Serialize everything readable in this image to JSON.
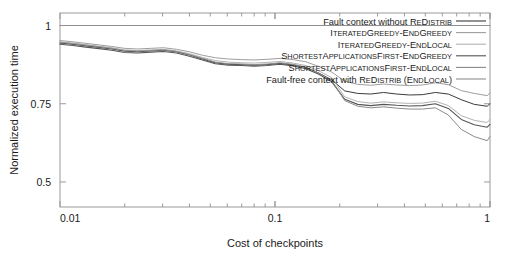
{
  "chart_data": {
    "type": "line",
    "title": "",
    "xlabel": "Cost of checkpoints",
    "ylabel": "Normalized execution time",
    "xscale": "log",
    "yscale": "linear",
    "xlim": [
      0.01,
      1
    ],
    "ylim": [
      0.42,
      1.04
    ],
    "xticks": [
      0.01,
      0.1,
      1
    ],
    "xticklabels": [
      "0.01",
      "0.1",
      "1"
    ],
    "yticks": [
      0.5,
      0.75,
      1
    ],
    "yticklabels": [
      "0.5",
      "0.75",
      "1"
    ],
    "grid": false,
    "legend_position": "top-right inside",
    "x": [
      0.01,
      0.0115,
      0.0132,
      0.0152,
      0.0174,
      0.02,
      0.023,
      0.0264,
      0.0303,
      0.0348,
      0.04,
      0.046,
      0.0528,
      0.0607,
      0.0697,
      0.08,
      0.0919,
      0.1056,
      0.1213,
      0.1393,
      0.16,
      0.1838,
      0.2111,
      0.2425,
      0.2786,
      0.32,
      0.3676,
      0.4223,
      0.4851,
      0.5572,
      0.64,
      0.7352,
      0.8445,
      0.97,
      1.0
    ],
    "series": [
      {
        "name": "Fault context without ReDistrib",
        "color": "#3a3a3a",
        "width": 1.0,
        "values": [
          0.944,
          0.94,
          0.935,
          0.93,
          0.925,
          0.918,
          0.916,
          0.919,
          0.921,
          0.916,
          0.906,
          0.893,
          0.881,
          0.876,
          0.875,
          0.873,
          0.875,
          0.879,
          0.874,
          0.866,
          0.848,
          0.826,
          0.791,
          0.783,
          0.781,
          0.786,
          0.781,
          0.778,
          0.779,
          0.786,
          0.781,
          0.763,
          0.748,
          0.742,
          0.75
        ]
      },
      {
        "name": "IteratedGreedy-EndGreedy",
        "color": "#9e9e9e",
        "width": 1.0,
        "values": [
          0.952,
          0.948,
          0.943,
          0.938,
          0.933,
          0.927,
          0.925,
          0.927,
          0.929,
          0.924,
          0.916,
          0.905,
          0.897,
          0.893,
          0.891,
          0.89,
          0.892,
          0.895,
          0.891,
          0.884,
          0.869,
          0.851,
          0.822,
          0.812,
          0.809,
          0.813,
          0.81,
          0.808,
          0.81,
          0.817,
          0.811,
          0.792,
          0.783,
          0.776,
          0.784
        ]
      },
      {
        "name": "IteratedGreedy-EndLocal",
        "color": "#b3b3b3",
        "width": 1.0,
        "values": [
          0.948,
          0.944,
          0.939,
          0.934,
          0.929,
          0.922,
          0.92,
          0.922,
          0.924,
          0.919,
          0.91,
          0.898,
          0.888,
          0.883,
          0.881,
          0.88,
          0.882,
          0.885,
          0.88,
          0.872,
          0.855,
          0.833,
          0.772,
          0.757,
          0.752,
          0.756,
          0.753,
          0.751,
          0.752,
          0.758,
          0.744,
          0.712,
          0.697,
          0.69,
          0.7
        ]
      },
      {
        "name": "ShortestApplicationsFirst-EndGreedy",
        "color": "#555555",
        "width": 1.1,
        "values": [
          0.94,
          0.936,
          0.931,
          0.926,
          0.921,
          0.914,
          0.912,
          0.915,
          0.917,
          0.912,
          0.902,
          0.89,
          0.878,
          0.873,
          0.872,
          0.87,
          0.872,
          0.876,
          0.871,
          0.862,
          0.844,
          0.82,
          0.764,
          0.748,
          0.744,
          0.748,
          0.745,
          0.743,
          0.744,
          0.75,
          0.735,
          0.7,
          0.683,
          0.675,
          0.684
        ]
      },
      {
        "name": "ShortestApplicationsFirst-EndLocal",
        "color": "#8a8a8a",
        "width": 1.0,
        "values": [
          0.946,
          0.942,
          0.937,
          0.932,
          0.927,
          0.92,
          0.918,
          0.92,
          0.922,
          0.917,
          0.907,
          0.895,
          0.883,
          0.878,
          0.877,
          0.875,
          0.877,
          0.881,
          0.876,
          0.867,
          0.848,
          0.824,
          0.76,
          0.742,
          0.737,
          0.74,
          0.736,
          0.733,
          0.733,
          0.737,
          0.714,
          0.668,
          0.645,
          0.632,
          0.645
        ]
      },
      {
        "name": "Fault-free context with ReDistrib (EndLocal)",
        "color": "#8f8f8f",
        "width": 1.1,
        "values": [
          1.0,
          1.0,
          1.0,
          1.0,
          1.0,
          1.0,
          1.0,
          1.0,
          1.0,
          1.0,
          1.0,
          1.0,
          1.0,
          1.0,
          1.0,
          1.0,
          1.0,
          1.0,
          1.0,
          1.0,
          1.0,
          1.0,
          1.0,
          1.0,
          1.0,
          1.0,
          1.0,
          1.0,
          1.0,
          1.0,
          1.0,
          1.0,
          1.0,
          1.0,
          1.0
        ]
      }
    ],
    "legend": [
      {
        "label": "Fault context without ReDistrib",
        "parts": [
          [
            "Fault context without ",
            "n"
          ],
          [
            "R",
            "n"
          ],
          [
            "E",
            "s"
          ],
          [
            "D",
            "n"
          ],
          [
            "ISTRIB",
            "s"
          ]
        ],
        "color": "#3a3a3a"
      },
      {
        "label": "IteratedGreedy-EndGreedy",
        "parts": [
          [
            "I",
            "n"
          ],
          [
            "TERATED",
            "s"
          ],
          [
            "G",
            "n"
          ],
          [
            "REEDY",
            "s"
          ],
          [
            "-",
            "n"
          ],
          [
            "E",
            "n"
          ],
          [
            "ND",
            "s"
          ],
          [
            "G",
            "n"
          ],
          [
            "REEDY",
            "s"
          ]
        ],
        "color": "#9e9e9e"
      },
      {
        "label": "IteratedGreedy-EndLocal",
        "parts": [
          [
            "I",
            "n"
          ],
          [
            "TERATED",
            "s"
          ],
          [
            "G",
            "n"
          ],
          [
            "REEDY",
            "s"
          ],
          [
            "-",
            "n"
          ],
          [
            "E",
            "n"
          ],
          [
            "ND",
            "s"
          ],
          [
            "L",
            "n"
          ],
          [
            "OCAL",
            "s"
          ]
        ],
        "color": "#b3b3b3"
      },
      {
        "label": "ShortestApplicationsFirst-EndGreedy",
        "parts": [
          [
            "S",
            "n"
          ],
          [
            "HORTEST",
            "s"
          ],
          [
            "A",
            "n"
          ],
          [
            "PPLICATIONS",
            "s"
          ],
          [
            "F",
            "n"
          ],
          [
            "IRST",
            "s"
          ],
          [
            "-",
            "n"
          ],
          [
            "E",
            "n"
          ],
          [
            "ND",
            "s"
          ],
          [
            "G",
            "n"
          ],
          [
            "REEDY",
            "s"
          ]
        ],
        "color": "#555555"
      },
      {
        "label": "ShortestApplicationsFirst-EndLocal",
        "parts": [
          [
            "S",
            "n"
          ],
          [
            "HORTEST",
            "s"
          ],
          [
            "A",
            "n"
          ],
          [
            "PPLICATIONS",
            "s"
          ],
          [
            "F",
            "n"
          ],
          [
            "IRST",
            "s"
          ],
          [
            "-",
            "n"
          ],
          [
            "E",
            "n"
          ],
          [
            "ND",
            "s"
          ],
          [
            "L",
            "n"
          ],
          [
            "OCAL",
            "s"
          ]
        ],
        "color": "#8a8a8a"
      },
      {
        "label": "Fault-free context with ReDistrib (EndLocal)",
        "parts": [
          [
            "Fault-free context with ",
            "n"
          ],
          [
            "R",
            "n"
          ],
          [
            "E",
            "s"
          ],
          [
            "D",
            "n"
          ],
          [
            "ISTRIB",
            "s"
          ],
          [
            " (",
            "n"
          ],
          [
            "E",
            "n"
          ],
          [
            "ND",
            "s"
          ],
          [
            "L",
            "n"
          ],
          [
            "OCAL",
            "s"
          ],
          [
            ")",
            "n"
          ]
        ],
        "color": "#8f8f8f"
      }
    ],
    "frame_color": "#9a9a9a"
  }
}
